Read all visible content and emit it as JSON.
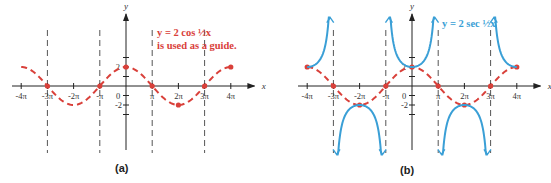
{
  "chart_data": [
    {
      "type": "line",
      "panel_label": "(a)",
      "xlabel": "x",
      "ylabel": "y",
      "x_ticks": [
        "-4π",
        "-3π",
        "-2π",
        "-π",
        "0",
        "π",
        "2π",
        "3π",
        "4π"
      ],
      "y_ticks": [
        "2",
        "-2"
      ],
      "xlim": [
        "-4π",
        "4π"
      ],
      "ylim": [
        -4,
        4
      ],
      "asymptotes_x": [
        "-3π",
        "-π",
        "π",
        "3π"
      ],
      "annotation": [
        "y = 2 cos ½x",
        "is used as a guide."
      ],
      "series": [
        {
          "name": "y = 2 cos ½x",
          "style": "dashed",
          "color": "#d9403a",
          "x_in_pi": [
            -4,
            -3,
            -2,
            -1,
            0,
            1,
            2,
            3,
            4
          ],
          "y": [
            2,
            0,
            -2,
            0,
            2,
            0,
            -2,
            0,
            2
          ],
          "marked_points": [
            [
              -3,
              0
            ],
            [
              -1,
              0
            ],
            [
              0,
              2
            ],
            [
              1,
              0
            ],
            [
              2,
              -2
            ],
            [
              3,
              0
            ],
            [
              4,
              2
            ]
          ]
        }
      ]
    },
    {
      "type": "line",
      "panel_label": "(b)",
      "xlabel": "x",
      "ylabel": "y",
      "x_ticks": [
        "-4π",
        "-3π",
        "-2π",
        "-π",
        "0",
        "π",
        "2π",
        "3π",
        "4π"
      ],
      "y_ticks": [
        "2",
        "-2"
      ],
      "xlim": [
        "-4π",
        "4π"
      ],
      "ylim": [
        -4,
        4
      ],
      "asymptotes_x": [
        "-3π",
        "-π",
        "π",
        "3π"
      ],
      "annotation": [
        "y = 2 sec ½x"
      ],
      "series": [
        {
          "name": "y = 2 cos ½x (guide)",
          "style": "dashed",
          "color": "#d9403a",
          "x_in_pi": [
            -4,
            -3,
            -2,
            -1,
            0,
            1,
            2,
            3,
            4
          ],
          "y": [
            2,
            0,
            -2,
            0,
            2,
            0,
            -2,
            0,
            2
          ]
        },
        {
          "name": "y = 2 sec ½x",
          "style": "solid",
          "color": "#3a9fd6",
          "branches": [
            {
              "x_in_pi_range": [
                -4,
                -3
              ],
              "direction": "up",
              "vertex": [
                -4,
                2
              ]
            },
            {
              "x_in_pi_range": [
                -3,
                -1
              ],
              "direction": "down",
              "vertex": [
                -2,
                -2
              ]
            },
            {
              "x_in_pi_range": [
                -1,
                1
              ],
              "direction": "up",
              "vertex": [
                0,
                2
              ]
            },
            {
              "x_in_pi_range": [
                1,
                3
              ],
              "direction": "down",
              "vertex": [
                2,
                -2
              ]
            },
            {
              "x_in_pi_range": [
                3,
                4
              ],
              "direction": "up",
              "vertex": [
                4,
                2
              ]
            }
          ]
        }
      ]
    }
  ],
  "colors": {
    "cos_guide": "#d9403a",
    "sec_curve": "#3a9fd6",
    "axis": "#333333",
    "asymptote": "#555555"
  }
}
